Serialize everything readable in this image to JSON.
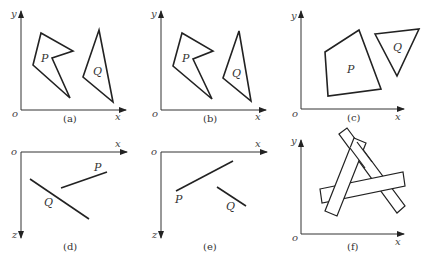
{
  "figure": {
    "panels": [
      {
        "id": "a",
        "caption": "(a)",
        "axes": {
          "origin": "o",
          "horizontal": "x",
          "vertical": "y"
        },
        "labels": {
          "P": "P",
          "Q": "Q"
        }
      },
      {
        "id": "b",
        "caption": "(b)",
        "axes": {
          "origin": "o",
          "horizontal": "x",
          "vertical": "y"
        },
        "labels": {
          "P": "P",
          "Q": "Q"
        }
      },
      {
        "id": "c",
        "caption": "(c)",
        "axes": {
          "origin": "o",
          "horizontal": "x",
          "vertical": "y"
        },
        "labels": {
          "P": "P",
          "Q": "Q"
        }
      },
      {
        "id": "d",
        "caption": "(d)",
        "axes": {
          "origin": "o",
          "horizontal": "x",
          "vertical": "z"
        },
        "labels": {
          "P": "P",
          "Q": "Q"
        }
      },
      {
        "id": "e",
        "caption": "(e)",
        "axes": {
          "origin": "o",
          "horizontal": "x",
          "vertical": "z"
        },
        "labels": {
          "P": "P",
          "Q": "Q"
        }
      },
      {
        "id": "f",
        "caption": "(f)",
        "axes": {
          "origin": "o",
          "horizontal": "x",
          "vertical": "y"
        },
        "labels": {}
      }
    ]
  },
  "colors": {
    "line": "#222222",
    "background": "#ffffff"
  }
}
